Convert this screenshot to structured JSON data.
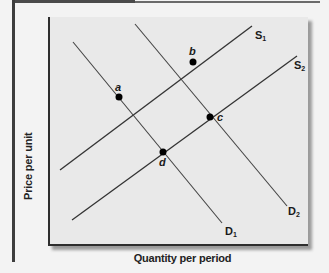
{
  "figure": {
    "x_axis_label": "Quantity per period",
    "y_axis_label": "Price per unit"
  },
  "curves": [
    {
      "id": "S1",
      "label": "S",
      "sub": "1",
      "type": "supply"
    },
    {
      "id": "S2",
      "label": "S",
      "sub": "2",
      "type": "supply"
    },
    {
      "id": "D1",
      "label": "D",
      "sub": "1",
      "type": "demand"
    },
    {
      "id": "D2",
      "label": "D",
      "sub": "2",
      "type": "demand"
    }
  ],
  "points": [
    {
      "id": "a",
      "label": "a",
      "intersection": "S1 ∩ D1"
    },
    {
      "id": "b",
      "label": "b",
      "intersection": "S1 ∩ D2"
    },
    {
      "id": "c",
      "label": "c",
      "intersection": "S2 ∩ D2"
    },
    {
      "id": "d",
      "label": "d",
      "intersection": "S2 ∩ D1"
    }
  ],
  "colors": {
    "background": "#f3f3f3",
    "plot_fill": "#e9e9e9",
    "line": "#333333",
    "point": "#000000"
  }
}
